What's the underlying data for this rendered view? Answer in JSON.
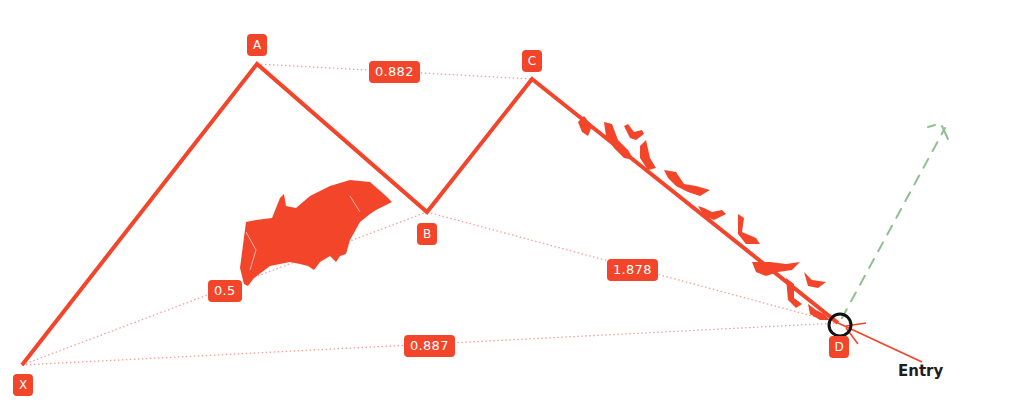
{
  "colors": {
    "pattern": "#f2452a",
    "ratio_line": "#f4a094",
    "target": "#8fc08f",
    "entry_circle": "#111111",
    "label_text": "#ffffff",
    "entry_text": "#1e1e1e"
  },
  "points": {
    "X": {
      "label": "X",
      "x": 22,
      "y": 365
    },
    "A": {
      "label": "A",
      "x": 257,
      "y": 64
    },
    "B": {
      "label": "B",
      "x": 427,
      "y": 212
    },
    "C": {
      "label": "C",
      "x": 532,
      "y": 79
    },
    "D": {
      "label": "D",
      "x": 838,
      "y": 323
    }
  },
  "ratios": {
    "xb": {
      "value": "0.5",
      "between": "XA-AB"
    },
    "ac": {
      "value": "0.882",
      "between": "AB-BC"
    },
    "bd": {
      "value": "1.878",
      "between": "BC-CD"
    },
    "xd": {
      "value": "0.887",
      "between": "XA-AD"
    }
  },
  "entry": {
    "label": "Entry"
  },
  "decorations": {
    "large_bat": "bat-illustration",
    "small_bats": "bat-swarm-along-CD"
  }
}
